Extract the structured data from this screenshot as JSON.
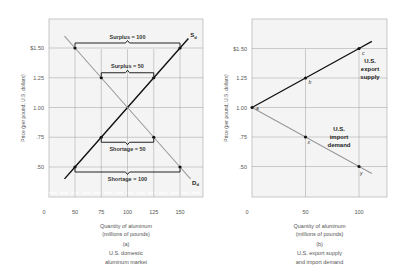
{
  "chart_data": [
    {
      "id": "a",
      "type": "line",
      "panel_label": "(a)",
      "caption_lines": [
        "U.S. domestic",
        "aluminum market"
      ],
      "xlabel_lines": [
        "Quantity of aluminum",
        "(millions of pounds)"
      ],
      "ylabel": "Price (per pound; U.S. dollars)",
      "x_ticks": [
        {
          "v": 0,
          "label": "0"
        },
        {
          "v": 50,
          "label": "50"
        },
        {
          "v": 75,
          "label": "75"
        },
        {
          "v": 100,
          "label": "100"
        },
        {
          "v": 125,
          "label": "125"
        },
        {
          "v": 150,
          "label": "150"
        }
      ],
      "y_ticks": [
        {
          "v": 1.5,
          "label": "$1.50"
        },
        {
          "v": 1.25,
          "label": "1.25"
        },
        {
          "v": 1.0,
          "label": "1.00"
        },
        {
          "v": 0.75,
          "label": ".75"
        },
        {
          "v": 0.5,
          "label": ".50"
        }
      ],
      "xlim": [
        35,
        165
      ],
      "ylim": [
        0.32,
        1.72
      ],
      "axis_break": true,
      "grid": true,
      "series": [
        {
          "name": "S_d",
          "label": "S",
          "subscript": "d",
          "color": "#111111",
          "width": 1.4,
          "x": [
            40,
            50,
            75,
            100,
            125,
            150,
            158
          ],
          "y": [
            0.4,
            0.5,
            0.75,
            1.0,
            1.25,
            1.5,
            1.58
          ]
        },
        {
          "name": "D_d",
          "label": "D",
          "subscript": "d",
          "color": "#999999",
          "width": 1.1,
          "x": [
            40,
            50,
            75,
            100,
            125,
            150,
            160
          ],
          "y": [
            1.6,
            1.5,
            1.25,
            1.0,
            0.75,
            0.5,
            0.4
          ]
        }
      ],
      "points": [
        {
          "x": 50,
          "y": 1.5
        },
        {
          "x": 150,
          "y": 1.5
        },
        {
          "x": 75,
          "y": 1.25
        },
        {
          "x": 125,
          "y": 1.25
        },
        {
          "x": 75,
          "y": 0.75
        },
        {
          "x": 125,
          "y": 0.75
        },
        {
          "x": 50,
          "y": 0.5
        },
        {
          "x": 150,
          "y": 0.5
        }
      ],
      "annotations": [
        {
          "text": "Surplus = 100",
          "x1": 50,
          "x2": 150,
          "y": 1.5,
          "pos": "above"
        },
        {
          "text": "Surplus = 50",
          "x1": 75,
          "x2": 125,
          "y": 1.25,
          "pos": "above"
        },
        {
          "text": "Shortage = 50",
          "x1": 75,
          "x2": 125,
          "y": 0.75,
          "pos": "below"
        },
        {
          "text": "Shortage = 100",
          "x1": 50,
          "x2": 150,
          "y": 0.5,
          "pos": "below"
        }
      ]
    },
    {
      "id": "b",
      "type": "line",
      "panel_label": "(b)",
      "caption_lines": [
        "U.S. export supply",
        "and import demand"
      ],
      "xlabel_lines": [
        "Quantity of aluminum",
        "(millions of pounds)"
      ],
      "ylabel": "Price (per pound; U.S. dollars)",
      "x_ticks": [
        {
          "v": 0,
          "label": "0"
        },
        {
          "v": 50,
          "label": "50"
        },
        {
          "v": 100,
          "label": "100"
        }
      ],
      "y_ticks": [
        {
          "v": 1.5,
          "label": "$1.50"
        },
        {
          "v": 1.25,
          "label": "1.25"
        },
        {
          "v": 1.0,
          "label": "1.00"
        },
        {
          "v": 0.75,
          "label": ".75"
        },
        {
          "v": 0.5,
          "label": ".50"
        }
      ],
      "xlim": [
        0,
        126
      ],
      "ylim": [
        0.32,
        1.72
      ],
      "grid": true,
      "series": [
        {
          "name": "U.S. export supply",
          "label_lines": [
            "U.S.",
            "export",
            "supply"
          ],
          "color": "#111111",
          "width": 1.4,
          "x": [
            0,
            50,
            100,
            112
          ],
          "y": [
            1.0,
            1.25,
            1.5,
            1.56
          ]
        },
        {
          "name": "U.S. import demand",
          "label_lines": [
            "U.S.",
            "import",
            "demand"
          ],
          "color": "#999999",
          "width": 1.1,
          "x": [
            0,
            50,
            100,
            112
          ],
          "y": [
            1.0,
            0.75,
            0.5,
            0.44
          ]
        }
      ],
      "points": [
        {
          "x": 0,
          "y": 1.0,
          "label": "a"
        },
        {
          "x": 50,
          "y": 1.25,
          "label": "b"
        },
        {
          "x": 100,
          "y": 1.5,
          "label": "c"
        },
        {
          "x": 50,
          "y": 0.75,
          "label": "x"
        },
        {
          "x": 100,
          "y": 0.5,
          "label": "y"
        }
      ]
    }
  ],
  "panels": {
    "a": {
      "frame": {
        "left": 49,
        "top": 19,
        "right": 203,
        "bottom": 197
      },
      "x0px": 22.5,
      "xscale": 1.05,
      "yzero_ref": {
        "v": 1.5,
        "px": 48
      },
      "yscale": 119
    },
    "b": {
      "frame": {
        "left": 252,
        "top": 19,
        "right": 387,
        "bottom": 197
      },
      "x0px": 252,
      "xscale": 1.07,
      "yzero_ref": {
        "v": 1.5,
        "px": 48.5
      },
      "yscale": 118
    }
  },
  "colors": {
    "frame": "#bbbbbb",
    "grid": "#888888",
    "panel_bg": "#f4f4f4",
    "bracket": "#222222"
  }
}
